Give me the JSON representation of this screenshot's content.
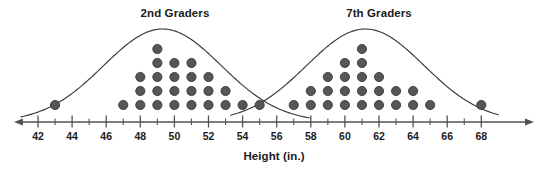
{
  "figure": {
    "axis_label": "Height (in.)",
    "groups": [
      {
        "key": "grade2",
        "title": "2nd Graders"
      },
      {
        "key": "grade7",
        "title": "7th Graders"
      }
    ],
    "colors": {
      "dot": "#565656",
      "dot_edge": "#2e2e2e",
      "axis": "#55534f",
      "curve": "#3a3a3a",
      "text": "#1b1b1b",
      "background": "#ffffff"
    }
  },
  "chart_data": {
    "type": "scatter",
    "plot_style": "dot-plot",
    "title": "",
    "xlabel": "Height (in.)",
    "ylabel": "",
    "xlim": [
      41,
      69
    ],
    "grid": false,
    "legend": "inline-group-titles",
    "axis": {
      "major_ticks": [
        42,
        44,
        46,
        48,
        50,
        52,
        54,
        56,
        58,
        60,
        62,
        64,
        66,
        68
      ],
      "minor_ticks": [
        43,
        45,
        47,
        49,
        51,
        53,
        55,
        57,
        59,
        61,
        63,
        65,
        67
      ],
      "tick_labels": [
        "42",
        "44",
        "46",
        "48",
        "50",
        "52",
        "54",
        "56",
        "58",
        "60",
        "62",
        "64",
        "66",
        "68"
      ],
      "arrows_both_ends": true
    },
    "series": [
      {
        "name": "2nd Graders",
        "x": [
          43,
          47,
          48,
          49,
          50,
          51,
          52,
          53,
          54,
          55
        ],
        "counts": [
          1,
          1,
          3,
          5,
          4,
          4,
          3,
          2,
          1,
          1
        ],
        "total": 25,
        "curve": "normal-overlay"
      },
      {
        "name": "7th Graders",
        "x": [
          57,
          58,
          59,
          60,
          61,
          62,
          63,
          64,
          65,
          68
        ],
        "counts": [
          1,
          2,
          3,
          4,
          5,
          3,
          2,
          2,
          1,
          1
        ],
        "total": 24,
        "curve": "normal-overlay"
      }
    ]
  },
  "ticks": [
    {
      "value": 42,
      "label": "42"
    },
    {
      "value": 44,
      "label": "44"
    },
    {
      "value": 46,
      "label": "46"
    },
    {
      "value": 48,
      "label": "48"
    },
    {
      "value": 50,
      "label": "50"
    },
    {
      "value": 52,
      "label": "52"
    },
    {
      "value": 54,
      "label": "54"
    },
    {
      "value": 56,
      "label": "56"
    },
    {
      "value": 58,
      "label": "58"
    },
    {
      "value": 60,
      "label": "60"
    },
    {
      "value": 62,
      "label": "62"
    },
    {
      "value": 64,
      "label": "64"
    },
    {
      "value": 66,
      "label": "66"
    },
    {
      "value": 68,
      "label": "68"
    }
  ]
}
